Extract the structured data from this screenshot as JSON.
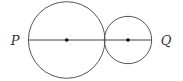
{
  "diagram": {
    "type": "geometry",
    "stroke_color": "#555555",
    "line_color": "#444444",
    "dot_color": "#111111",
    "label_color": "#333333",
    "points": {
      "P": {
        "label": "P",
        "x": 15,
        "y": 45
      },
      "Q": {
        "label": "Q",
        "x": 166,
        "y": 45
      }
    },
    "large_circle": {
      "cx": 66.7,
      "cy": 40,
      "r": 38.3
    },
    "small_circle": {
      "cx": 128,
      "cy": 40,
      "r": 23.7
    },
    "segment": {
      "x1": 28.4,
      "y1": 40,
      "x2": 151.7,
      "y2": 40
    },
    "centers": [
      {
        "name": "large-center",
        "cx": 66.7,
        "cy": 40,
        "r": 1.8
      },
      {
        "name": "small-center",
        "cx": 128,
        "cy": 40,
        "r": 1.8
      }
    ]
  }
}
